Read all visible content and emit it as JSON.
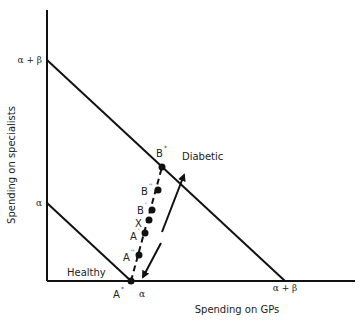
{
  "axes": {
    "x_label": "Spending on GPs",
    "y_label": "Spending on specialists",
    "y_ticks": [
      {
        "label": "α + β",
        "y": 60
      },
      {
        "label": "α",
        "y": 203
      }
    ],
    "x_ticks": [
      {
        "label": "α",
        "x": 142
      },
      {
        "label": "α + β",
        "x": 285
      }
    ]
  },
  "lines": {
    "healthy_label": "Healthy",
    "diabetic_label": "Diabetic"
  },
  "points": [
    {
      "id": "A_star",
      "base": "A",
      "sup": "*"
    },
    {
      "id": "B_star",
      "base": "B",
      "sup": "*"
    },
    {
      "id": "B_dprime",
      "base": "B",
      "sup": "''"
    },
    {
      "id": "B_prime",
      "base": "B",
      "sup": "'"
    },
    {
      "id": "X",
      "base": "X",
      "sup": ""
    },
    {
      "id": "A_prime",
      "base": "A",
      "sup": "'"
    },
    {
      "id": "A_dprime",
      "base": "A",
      "sup": "''"
    }
  ],
  "colors": {
    "line": "#111111",
    "text": "#222222"
  }
}
